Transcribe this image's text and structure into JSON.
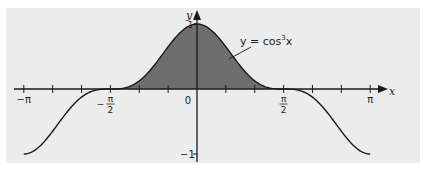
{
  "chart_data": {
    "type": "line",
    "title": "",
    "function": "cos^3(x)",
    "curve_label": {
      "prefix": "y",
      "eq": " = cos",
      "exp": "3",
      "var": "x"
    },
    "xlabel": "x",
    "ylabel": "y",
    "xlim": [
      -3.14159,
      3.14159
    ],
    "ylim": [
      -1,
      1
    ],
    "x_tick_step": 0.5236,
    "x_tick_labels": [
      {
        "value": -3.14159,
        "label": "−π"
      },
      {
        "value": -1.5708,
        "label_num": "π",
        "label_den": "2",
        "sign": "−"
      },
      {
        "value": 0,
        "label": "0"
      },
      {
        "value": 1.5708,
        "label_num": "π",
        "label_den": "2",
        "sign": ""
      },
      {
        "value": 3.14159,
        "label": "π"
      }
    ],
    "y_tick_labels": [
      {
        "value": 1,
        "label": "1"
      },
      {
        "value": -1,
        "label": "−1"
      }
    ],
    "shaded_region": {
      "from": -1.5708,
      "to": 1.5708,
      "description": "area under curve above x-axis"
    },
    "sample_points": [
      {
        "x": -3.14159,
        "y": -1
      },
      {
        "x": -2.0944,
        "y": -0.125
      },
      {
        "x": -1.5708,
        "y": 0
      },
      {
        "x": -1.0472,
        "y": 0.125
      },
      {
        "x": 0,
        "y": 1
      },
      {
        "x": 1.0472,
        "y": 0.125
      },
      {
        "x": 1.5708,
        "y": 0
      },
      {
        "x": 2.0944,
        "y": -0.125
      },
      {
        "x": 3.14159,
        "y": -1
      }
    ],
    "grid": false,
    "legend": "none"
  },
  "colors": {
    "panel_bg": "#ececec",
    "shade": "#6e6e6e",
    "curve": "#1a1a1a",
    "axis": "#1a1a1a",
    "text": "#1e1e1e"
  }
}
